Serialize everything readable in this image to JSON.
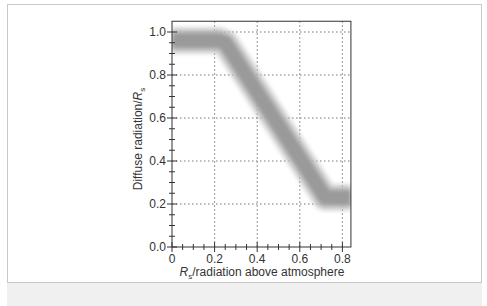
{
  "chart_data": {
    "type": "line",
    "title": "",
    "xlabel": "Rs/radiation above atmosphere",
    "ylabel": "Diffuse radiation/Rs",
    "xlabel_parts": {
      "symbol": "R",
      "subscript": "s",
      "rest": "/radiation above atmosphere"
    },
    "ylabel_parts": {
      "text": "Diffuse radiation/",
      "symbol": "R",
      "subscript": "s"
    },
    "xlim": [
      0,
      0.84
    ],
    "ylim": [
      0,
      1.05
    ],
    "x_ticks": [
      "0",
      "0.2",
      "0.4",
      "0.6",
      "0.8"
    ],
    "y_ticks": [
      "0.0",
      "0.2",
      "0.4",
      "0.6",
      "0.8",
      "1.0"
    ],
    "grid": true,
    "legend": null,
    "series": [
      {
        "name": "Diffuse fraction band",
        "x": [
          0,
          0.22,
          0.25,
          0.72,
          0.84
        ],
        "y": [
          0.96,
          0.96,
          0.95,
          0.23,
          0.23
        ],
        "style": "thick gray blurred band"
      }
    ]
  },
  "colors": {
    "band": "#9a9a9a",
    "grid": "#777777",
    "axis": "#333333"
  }
}
